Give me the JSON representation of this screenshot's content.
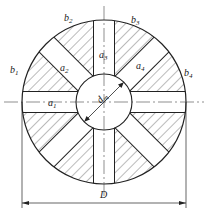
{
  "diagram": {
    "center": [
      104,
      102
    ],
    "outer_radius": 82,
    "inner_radius": 28,
    "slot_width": 21,
    "slot_angles_deg": [
      0,
      45,
      90,
      135
    ],
    "labels": {
      "a1": {
        "base": "a",
        "sub": "1"
      },
      "a2": {
        "base": "a",
        "sub": "2"
      },
      "a3": {
        "base": "a",
        "sub": "3"
      },
      "a4": {
        "base": "a",
        "sub": "4"
      },
      "b1": {
        "base": "b",
        "sub": "1"
      },
      "b2": {
        "base": "b",
        "sub": "2"
      },
      "b3": {
        "base": "b",
        "sub": "3"
      },
      "b4": {
        "base": "b",
        "sub": "4"
      },
      "dm": {
        "base": "d",
        "sub": "m"
      },
      "D": "D"
    },
    "colors": {
      "line": "#222222",
      "hatch": "#555555",
      "background": "#ffffff"
    }
  }
}
